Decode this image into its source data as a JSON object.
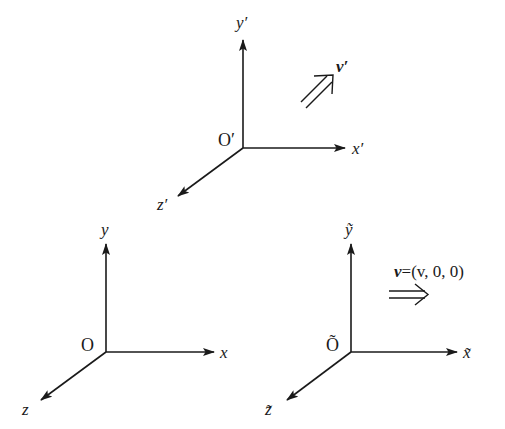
{
  "diagram": {
    "frames": [
      {
        "id": "primed",
        "origin_label": "O′",
        "x_label": "x′",
        "y_label": "y′",
        "z_label": "z′",
        "velocity_label": "v′"
      },
      {
        "id": "lab",
        "origin_label": "O",
        "x_label": "x",
        "y_label": "y",
        "z_label": "z"
      },
      {
        "id": "tilde",
        "origin_label": "Õ",
        "x_label": "x̃",
        "y_label": "ỹ",
        "z_label": "z̃",
        "velocity_label_bold": "v",
        "velocity_label_rest": "=(v, 0, 0)"
      }
    ],
    "colors": {
      "ink": "#1a1a1a",
      "background": "#ffffff"
    }
  }
}
